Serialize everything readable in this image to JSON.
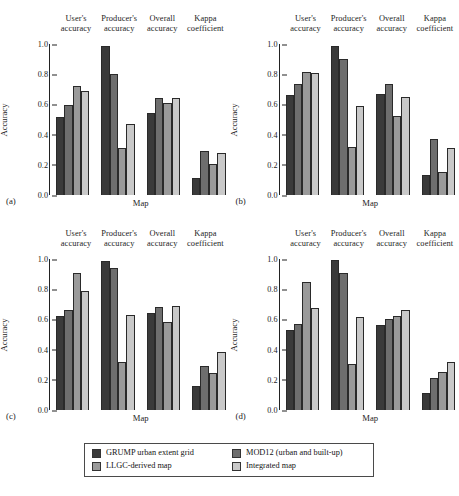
{
  "figure": {
    "ylabel": "Accuracy",
    "xlabel": "Map",
    "y_ticks": [
      "1.0",
      "0.8",
      "0.6",
      "0.4",
      "0.2",
      "0.0"
    ],
    "group_labels": [
      {
        "line1": "User's",
        "line2": "accuracy"
      },
      {
        "line1": "Producer's",
        "line2": "accuracy"
      },
      {
        "line1": "Overall",
        "line2": "accuracy"
      },
      {
        "line1": "Kappa",
        "line2": "coefficient"
      }
    ],
    "panel_tags": [
      "(a)",
      "(b)",
      "(c)",
      "(d)"
    ],
    "caption": ""
  },
  "legend": {
    "items": [
      {
        "label": "GRUMP urban extent grid",
        "color": "#3a3a3a",
        "series": 0
      },
      {
        "label": "MOD12 (urban and built-up)",
        "color": "#6e6e6e",
        "series": 1
      },
      {
        "label": "LLGC-derived map",
        "color": "#9a9a9a",
        "series": 2
      },
      {
        "label": "Integrated map",
        "color": "#c9c9c9",
        "series": 3
      }
    ]
  },
  "chart_data": [
    {
      "type": "bar",
      "panel": "(a)",
      "title": "",
      "xlabel": "Map",
      "ylabel": "Accuracy",
      "ylim": [
        0,
        1.0
      ],
      "yticks": [
        0.0,
        0.2,
        0.4,
        0.6,
        0.8,
        1.0
      ],
      "grid": false,
      "legend_position": "below-figure",
      "categories": [
        "User's accuracy",
        "Producer's accuracy",
        "Overall accuracy",
        "Kappa coefficient"
      ],
      "series": [
        {
          "name": "GRUMP urban extent grid",
          "values": [
            0.515,
            0.985,
            0.545,
            0.115
          ]
        },
        {
          "name": "MOD12 (urban and built-up)",
          "values": [
            0.595,
            0.8,
            0.64,
            0.29
          ]
        },
        {
          "name": "LLGC-derived map",
          "values": [
            0.725,
            0.31,
            0.61,
            0.205
          ]
        },
        {
          "name": "Integrated map",
          "values": [
            0.69,
            0.47,
            0.645,
            0.28
          ]
        }
      ]
    },
    {
      "type": "bar",
      "panel": "(b)",
      "title": "",
      "xlabel": "Map",
      "ylabel": "Accuracy",
      "ylim": [
        0,
        1.0
      ],
      "yticks": [
        0.0,
        0.2,
        0.4,
        0.6,
        0.8,
        1.0
      ],
      "grid": false,
      "legend_position": "below-figure",
      "categories": [
        "User's accuracy",
        "Producer's accuracy",
        "Overall accuracy",
        "Kappa coefficient"
      ],
      "series": [
        {
          "name": "GRUMP urban extent grid",
          "values": [
            0.66,
            0.985,
            0.67,
            0.13
          ]
        },
        {
          "name": "MOD12 (urban and built-up)",
          "values": [
            0.735,
            0.9,
            0.735,
            0.37
          ]
        },
        {
          "name": "LLGC-derived map",
          "values": [
            0.815,
            0.315,
            0.52,
            0.155
          ]
        },
        {
          "name": "Integrated map",
          "values": [
            0.805,
            0.59,
            0.65,
            0.31
          ]
        }
      ]
    },
    {
      "type": "bar",
      "panel": "(c)",
      "title": "",
      "xlabel": "Map",
      "ylabel": "Accuracy",
      "ylim": [
        0,
        1.0
      ],
      "yticks": [
        0.0,
        0.2,
        0.4,
        0.6,
        0.8,
        1.0
      ],
      "grid": false,
      "legend_position": "below-figure",
      "categories": [
        "User's accuracy",
        "Producer's accuracy",
        "Overall accuracy",
        "Kappa coefficient"
      ],
      "series": [
        {
          "name": "GRUMP urban extent grid",
          "values": [
            0.62,
            0.99,
            0.64,
            0.16
          ]
        },
        {
          "name": "MOD12 (urban and built-up)",
          "values": [
            0.66,
            0.94,
            0.685,
            0.29
          ]
        },
        {
          "name": "LLGC-derived map",
          "values": [
            0.905,
            0.32,
            0.585,
            0.245
          ]
        },
        {
          "name": "Integrated map",
          "values": [
            0.79,
            0.63,
            0.69,
            0.385
          ]
        }
      ]
    },
    {
      "type": "bar",
      "panel": "(d)",
      "title": "",
      "xlabel": "Map",
      "ylabel": "Accuracy",
      "ylim": [
        0,
        1.0
      ],
      "yticks": [
        0.0,
        0.2,
        0.4,
        0.6,
        0.8,
        1.0
      ],
      "grid": false,
      "legend_position": "below-figure",
      "categories": [
        "User's accuracy",
        "Producer's accuracy",
        "Overall accuracy",
        "Kappa coefficient"
      ],
      "series": [
        {
          "name": "GRUMP urban extent grid",
          "values": [
            0.53,
            0.995,
            0.56,
            0.115
          ]
        },
        {
          "name": "MOD12 (urban and built-up)",
          "values": [
            0.57,
            0.905,
            0.605,
            0.21
          ]
        },
        {
          "name": "LLGC-derived map",
          "values": [
            0.85,
            0.305,
            0.62,
            0.25
          ]
        },
        {
          "name": "Integrated map",
          "values": [
            0.675,
            0.615,
            0.66,
            0.32
          ]
        }
      ]
    }
  ]
}
